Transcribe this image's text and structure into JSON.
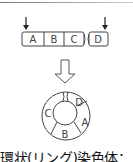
{
  "diagram": {
    "linear_chromosome": {
      "segments": [
        "A",
        "B",
        "C",
        "D"
      ],
      "break_arrows": [
        "left-end",
        "right-end"
      ]
    },
    "transition_arrow": "hollow-down-arrow",
    "ring_chromosome": {
      "segments": [
        "C",
        "D",
        "A",
        "B"
      ]
    },
    "caption": "環状(リング)染色体："
  },
  "colors": {
    "stroke": "#333333",
    "background": "#ffffff"
  }
}
